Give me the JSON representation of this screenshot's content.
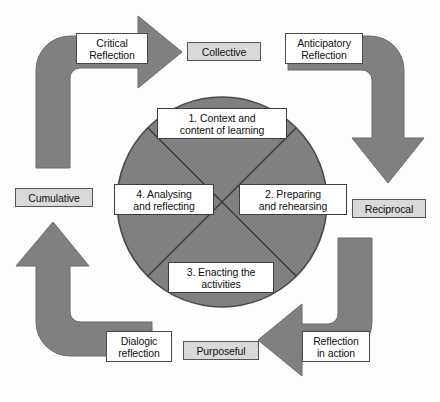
{
  "diagram": {
    "colors": {
      "arrow_fill": "#808080",
      "arrow_stroke": "#5a5a5a",
      "circle_fill": "#808080",
      "circle_stroke": "#4a4a4a",
      "label_gray_fill": "#d9d9d9",
      "label_white_fill": "#ffffff",
      "label_border": "#4a4a4a",
      "text": "#111111",
      "background": "#fdfdfd"
    },
    "circle": {
      "quadrants": [
        {
          "id": "quadrant-1",
          "label": "1. Context and\ncontent of learning"
        },
        {
          "id": "quadrant-2",
          "label": "2. Preparing\nand rehearsing"
        },
        {
          "id": "quadrant-3",
          "label": "3. Enacting the\nactivities"
        },
        {
          "id": "quadrant-4",
          "label": "4. Analysing\nand reflecting"
        }
      ]
    },
    "arrows": [
      {
        "id": "arrow-top-left",
        "label": "Critical\nReflection",
        "direction": "up-then-right",
        "label_style": "white"
      },
      {
        "id": "arrow-top-right",
        "label": "Anticipatory\nReflection",
        "direction": "right-then-down",
        "label_style": "white"
      },
      {
        "id": "arrow-bottom-right",
        "label": "Reflection\nin action",
        "direction": "down-then-left",
        "label_style": "white"
      },
      {
        "id": "arrow-bottom-left",
        "label": "Dialogic\nreflection",
        "direction": "left-then-up",
        "label_style": "white"
      }
    ],
    "attributes": [
      {
        "id": "attribute-collective",
        "label": "Collective",
        "position": "top",
        "label_style": "gray"
      },
      {
        "id": "attribute-reciprocal",
        "label": "Reciprocal",
        "position": "right",
        "label_style": "gray"
      },
      {
        "id": "attribute-purposeful",
        "label": "Purposeful",
        "position": "bottom",
        "label_style": "gray"
      },
      {
        "id": "attribute-cumulative",
        "label": "Cumulative",
        "position": "left",
        "label_style": "gray"
      }
    ]
  }
}
